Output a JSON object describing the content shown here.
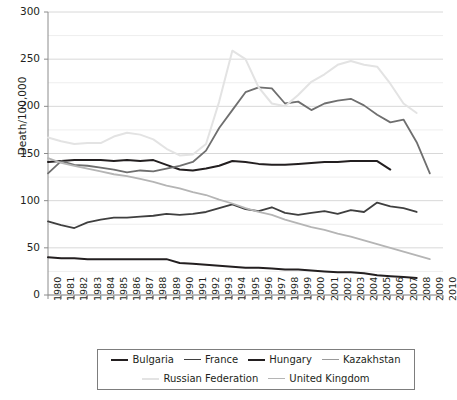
{
  "chart_data": {
    "type": "line",
    "title": "",
    "xlabel": "",
    "ylabel": "Death/100,000",
    "xlim": [
      1980,
      2010
    ],
    "ylim": [
      0,
      300
    ],
    "yticks": [
      0,
      50,
      100,
      150,
      200,
      250,
      300
    ],
    "ytick_labels": [
      "0",
      "50",
      "100",
      "150",
      "200",
      "250",
      "300"
    ],
    "gridlines_minor_step": 25,
    "grid": true,
    "legend_position": "bottom",
    "x": [
      1980,
      1981,
      1982,
      1983,
      1984,
      1985,
      1986,
      1987,
      1988,
      1989,
      1990,
      1991,
      1992,
      1993,
      1994,
      1995,
      1996,
      1997,
      1998,
      1999,
      2000,
      2001,
      2002,
      2003,
      2004,
      2005,
      2006,
      2007,
      2008,
      2009,
      2010
    ],
    "xtick_labels": [
      "1980",
      "1981",
      "1982",
      "1983",
      "1984",
      "1985",
      "1986",
      "1987",
      "1988",
      "1989",
      "1990",
      "1991",
      "1992",
      "1993",
      "1994",
      "1995",
      "1996",
      "1997",
      "1998",
      "1999",
      "2000",
      "2001",
      "2002",
      "2003",
      "2004",
      "2005",
      "2006",
      "2007",
      "2008",
      "2009",
      "2010"
    ],
    "series": [
      {
        "name": "Bulgaria",
        "color": "#231f20",
        "width": 2.0,
        "values": [
          141,
          142,
          143,
          143,
          143,
          142,
          143,
          142,
          143,
          138,
          133,
          132,
          134,
          137,
          142,
          141,
          139,
          138,
          138,
          139,
          140,
          141,
          141,
          142,
          142,
          142,
          133,
          null,
          null,
          null,
          null
        ]
      },
      {
        "name": "France",
        "color": "#3f3f3f",
        "width": 1.8,
        "values": [
          78,
          74,
          71,
          77,
          80,
          82,
          82,
          83,
          84,
          86,
          85,
          86,
          88,
          92,
          96,
          91,
          89,
          93,
          87,
          85,
          87,
          89,
          86,
          90,
          88,
          98,
          94,
          92,
          88,
          null,
          null
        ]
      },
      {
        "name": "Hungary",
        "color": "#231f20",
        "width": 2.0,
        "values": [
          40,
          39,
          39,
          38,
          38,
          38,
          38,
          38,
          38,
          38,
          34,
          33,
          32,
          31,
          30,
          29,
          29,
          28,
          27,
          27,
          26,
          25,
          24,
          24,
          23,
          21,
          20,
          19,
          18,
          null,
          null
        ]
      },
      {
        "name": "Kazakhstan",
        "color": "#6f6f6f",
        "width": 1.8,
        "values": [
          129,
          142,
          138,
          137,
          135,
          133,
          130,
          132,
          131,
          134,
          137,
          141,
          153,
          177,
          196,
          215,
          220,
          219,
          203,
          205,
          196,
          203,
          206,
          208,
          201,
          191,
          183,
          186,
          162,
          129,
          null
        ]
      },
      {
        "name": "Russian Federation",
        "color": "#e3e3e3",
        "width": 2.0,
        "values": [
          167,
          163,
          160,
          161,
          161,
          168,
          172,
          170,
          165,
          155,
          148,
          149,
          160,
          205,
          259,
          250,
          220,
          203,
          200,
          212,
          226,
          234,
          244,
          248,
          244,
          242,
          224,
          203,
          193,
          null,
          null
        ]
      },
      {
        "name": "United Kingdom",
        "color": "#b5b5b5",
        "width": 1.8,
        "values": [
          145,
          140,
          137,
          134,
          131,
          128,
          126,
          123,
          120,
          116,
          113,
          109,
          106,
          101,
          97,
          92,
          88,
          85,
          80,
          76,
          72,
          69,
          65,
          62,
          58,
          54,
          50,
          46,
          42,
          38,
          null
        ]
      }
    ]
  },
  "legend": {
    "row1": [
      {
        "label": "Bulgaria",
        "color": "#231f20",
        "width": 2.0
      },
      {
        "label": "France",
        "color": "#3f3f3f",
        "width": 1.8
      },
      {
        "label": "Hungary",
        "color": "#231f20",
        "width": 2.0
      },
      {
        "label": "Kazakhstan",
        "color": "#9a9a9a",
        "width": 1.8
      }
    ],
    "row2": [
      {
        "label": "Russian Federation",
        "color": "#e3e3e3",
        "width": 2.0
      },
      {
        "label": "United Kingdom",
        "color": "#b5b5b5",
        "width": 1.8
      }
    ]
  }
}
